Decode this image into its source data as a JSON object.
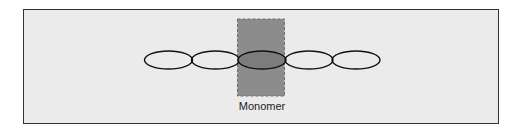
{
  "diagram": {
    "type": "polymer-chain",
    "monomer_label": "Monomer",
    "units": 5,
    "highlighted_unit_index": 2,
    "colors": {
      "background": "#ebebeb",
      "frame_border": "#333333",
      "highlight_fill": "#8c8c8c",
      "highlight_border": "#707070",
      "unit_stroke": "#111111"
    }
  }
}
